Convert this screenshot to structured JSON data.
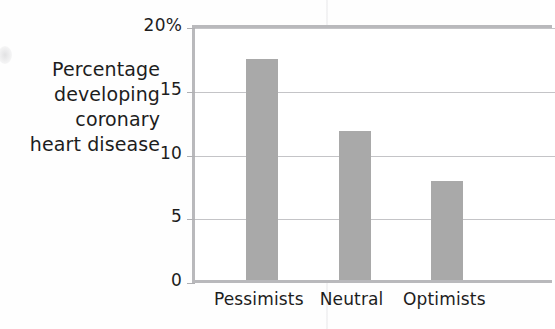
{
  "chart_data": {
    "type": "bar",
    "title": "",
    "xlabel": "",
    "ylabel": "Percentage developing coronary heart disease",
    "ylabel_lines": [
      "Percentage",
      "developing",
      "coronary",
      "heart disease"
    ],
    "categories": [
      "Pessimists",
      "Neutral",
      "Optimists"
    ],
    "values": [
      17.3,
      11.7,
      7.8
    ],
    "ylim": [
      0,
      20
    ],
    "yticks": [
      0,
      5,
      10,
      15,
      20
    ],
    "ytick_labels": [
      "0",
      "5",
      "10",
      "15",
      "20%"
    ],
    "grid": true,
    "legend": false,
    "bar_color": "#a9a9a9",
    "axis_color": "#b9b9bc",
    "grid_color": "#c4c4c7",
    "text_color": "#1d1d1d"
  }
}
